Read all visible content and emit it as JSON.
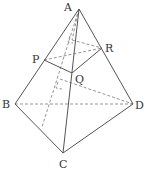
{
  "diagram": {
    "points": {
      "A": {
        "label": "A",
        "x": 79,
        "y": 9,
        "lx": 64,
        "ly": 11
      },
      "B": {
        "label": "B",
        "x": 15,
        "y": 104,
        "lx": 2,
        "ly": 108
      },
      "C": {
        "label": "C",
        "x": 63,
        "y": 153,
        "lx": 59,
        "ly": 168
      },
      "D": {
        "label": "D",
        "x": 133,
        "y": 104,
        "lx": 135,
        "ly": 109
      },
      "P": {
        "label": "P",
        "x": 44,
        "y": 60,
        "lx": 32,
        "ly": 63
      },
      "Q": {
        "label": "Q",
        "x": 72,
        "y": 73,
        "lx": 75,
        "ly": 83
      },
      "R": {
        "label": "R",
        "x": 102,
        "y": 48,
        "lx": 105,
        "ly": 52
      }
    },
    "solid_edges": [
      "AB",
      "AC",
      "AD",
      "BC",
      "CD",
      "PQ",
      "QR"
    ],
    "dashed_edges": [
      "BD",
      "PR",
      "A-H1",
      "H1-R",
      "H2-D"
    ],
    "right_angle_marks": 2,
    "colors": {
      "line": "#555555",
      "dashed": "#8a8a8a",
      "text": "#333333"
    }
  }
}
